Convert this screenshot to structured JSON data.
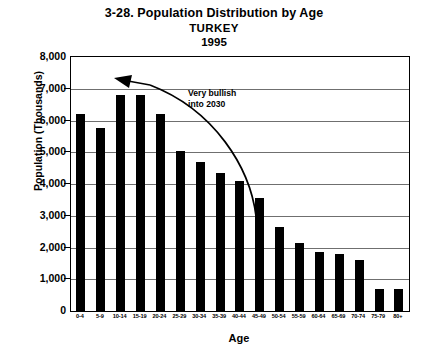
{
  "chart_data": {
    "type": "bar",
    "title": "3-28. Population Distribution by Age",
    "subtitle": "TURKEY",
    "subtitle2": "1995",
    "xlabel": "Age",
    "ylabel": "Population (Thousands)",
    "ylim": [
      0,
      8000
    ],
    "ytick_labels": [
      "8,000",
      "7,000",
      "6,000",
      "5,000",
      "4,000",
      "3,000",
      "2,000",
      "1,000",
      "0"
    ],
    "ytick_values": [
      8000,
      7000,
      6000,
      5000,
      4000,
      3000,
      2000,
      1000,
      0
    ],
    "grid": true,
    "legend": "none",
    "bar_color": "#000000",
    "categories": [
      "0-4",
      "5-9",
      "10-14",
      "15-19",
      "20-24",
      "25-29",
      "30-34",
      "35-39",
      "40-44",
      "45-49",
      "50-54",
      "55-59",
      "60-64",
      "65-69",
      "70-74",
      "75-79",
      "80+"
    ],
    "values": [
      6200,
      5750,
      6800,
      6800,
      6200,
      5050,
      4700,
      4350,
      4100,
      3550,
      2650,
      2150,
      1850,
      1800,
      1600,
      700,
      700
    ],
    "annotations": [
      {
        "text": "Very bullish\ninto 2030",
        "arrow": "curved-arrow-pointing-up-left"
      }
    ]
  }
}
